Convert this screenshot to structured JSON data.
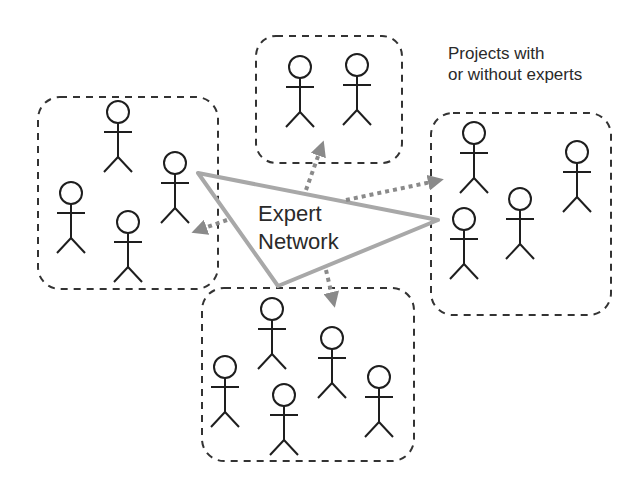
{
  "diagram": {
    "caption_line1": "Projects with",
    "caption_line2": "or without experts",
    "center_line1": "Expert",
    "center_line2": "Network",
    "colors": {
      "stick_figure": "#1e1e1e",
      "group_border": "#333333",
      "network_triangle": "#a8a8a8",
      "arrows": "#8a8a8a"
    },
    "groups": [
      {
        "name": "left-group",
        "people": 5
      },
      {
        "name": "top-group",
        "people": 2
      },
      {
        "name": "right-group",
        "people": 4
      },
      {
        "name": "bottom-group",
        "people": 6
      }
    ]
  }
}
